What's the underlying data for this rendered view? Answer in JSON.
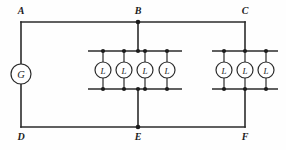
{
  "diagram": {
    "type": "electrical-circuit-schematic",
    "title": "",
    "background_color": "#fefefe",
    "wire_color": "#2b2b2b",
    "node_labels": [
      {
        "id": "A",
        "text": "A",
        "x": 21,
        "y": 10,
        "corner_x": 21,
        "corner_y": 22
      },
      {
        "id": "B",
        "text": "B",
        "x": 138,
        "y": 10,
        "corner_x": 138,
        "corner_y": 22
      },
      {
        "id": "C",
        "text": "C",
        "x": 245,
        "y": 10,
        "corner_x": 245,
        "corner_y": 22
      },
      {
        "id": "D",
        "text": "D",
        "x": 21,
        "y": 136,
        "corner_x": 21,
        "corner_y": 127
      },
      {
        "id": "E",
        "text": "E",
        "x": 138,
        "y": 136,
        "corner_x": 138,
        "corner_y": 127
      },
      {
        "id": "F",
        "text": "F",
        "x": 245,
        "y": 136,
        "corner_x": 245,
        "corner_y": 127
      }
    ],
    "generator": {
      "symbol_text": "G",
      "name": "generator",
      "cx": 21,
      "cy": 74,
      "r": 10
    },
    "lamp_symbol_text": "L",
    "groups": [
      {
        "name": "left-lamp-bank",
        "lamp_count": 4,
        "bus_x_start": 88,
        "bus_x_end": 182,
        "bus_top_y": 51,
        "bus_bottom_y": 89,
        "lamp_xs": [
          103,
          124,
          145,
          167
        ],
        "lamp_r": 8,
        "feed_x": 138
      },
      {
        "name": "right-lamp-bank",
        "lamp_count": 3,
        "bus_x_start": 212,
        "bus_x_end": 278,
        "bus_top_y": 51,
        "bus_bottom_y": 89,
        "lamp_xs": [
          224,
          245,
          266
        ],
        "lamp_r": 8,
        "feed_x": 245
      }
    ],
    "frame": {
      "left_x": 21,
      "right_x": 245,
      "top_y": 22,
      "bottom_y": 127
    },
    "junction_dots": [
      {
        "x": 138,
        "y": 22
      },
      {
        "x": 138,
        "y": 127
      },
      {
        "x": 103,
        "y": 51
      },
      {
        "x": 124,
        "y": 51
      },
      {
        "x": 138,
        "y": 51
      },
      {
        "x": 145,
        "y": 51
      },
      {
        "x": 167,
        "y": 51
      },
      {
        "x": 103,
        "y": 89
      },
      {
        "x": 124,
        "y": 89
      },
      {
        "x": 138,
        "y": 89
      },
      {
        "x": 145,
        "y": 89
      },
      {
        "x": 167,
        "y": 89
      },
      {
        "x": 224,
        "y": 51
      },
      {
        "x": 245,
        "y": 51
      },
      {
        "x": 266,
        "y": 51
      },
      {
        "x": 224,
        "y": 89
      },
      {
        "x": 245,
        "y": 89
      },
      {
        "x": 266,
        "y": 89
      }
    ]
  }
}
